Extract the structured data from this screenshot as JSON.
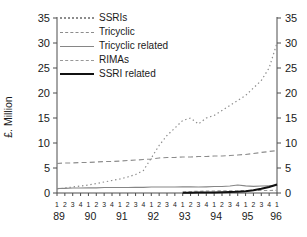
{
  "chart_data": {
    "type": "line",
    "title": "",
    "ylabel": "£. Million",
    "ylim": [
      0,
      35
    ],
    "y_ticks": [
      0,
      5,
      10,
      15,
      20,
      25,
      30,
      35
    ],
    "dual_y_axis": true,
    "grid": false,
    "legend_position": "top-left",
    "axis_color": "#4d4d4d",
    "text_color": "#1a1a1a",
    "background": "#ffffff",
    "x": [
      "89Q1",
      "89Q2",
      "89Q3",
      "89Q4",
      "90Q1",
      "90Q2",
      "90Q3",
      "90Q4",
      "91Q1",
      "91Q2",
      "91Q3",
      "91Q4",
      "92Q1",
      "92Q2",
      "92Q3",
      "92Q4",
      "93Q1",
      "93Q2",
      "93Q3",
      "93Q4",
      "94Q1",
      "94Q2",
      "94Q3",
      "94Q4",
      "95Q1",
      "95Q2",
      "95Q3",
      "95Q4",
      "96Q1"
    ],
    "quarter_labels": [
      "1",
      "2",
      "3",
      "4",
      "1",
      "2",
      "3",
      "4",
      "1",
      "2",
      "3",
      "4",
      "1",
      "2",
      "3",
      "4",
      "1",
      "2",
      "3",
      "4",
      "1",
      "2",
      "3",
      "4",
      "1",
      "2",
      "3",
      "4",
      "1"
    ],
    "year_labels": [
      "89",
      "90",
      "91",
      "92",
      "93",
      "94",
      "95",
      "96"
    ],
    "series": [
      {
        "name": "SSRIs",
        "style": "dotted",
        "color": "#8c8c8c",
        "width": 1.2,
        "values": [
          0.8,
          1.0,
          1.2,
          1.4,
          1.6,
          1.9,
          2.2,
          2.5,
          2.8,
          3.2,
          3.7,
          4.5,
          7.0,
          9.5,
          11.5,
          13.0,
          14.5,
          15.0,
          13.8,
          15.0,
          15.5,
          16.5,
          17.5,
          18.5,
          19.5,
          21.0,
          22.5,
          25.0,
          30.0
        ]
      },
      {
        "name": "Tricyclic",
        "style": "dashed",
        "color": "#8c8c8c",
        "width": 1.2,
        "values": [
          5.9,
          6.0,
          6.0,
          6.1,
          6.1,
          6.2,
          6.3,
          6.3,
          6.4,
          6.5,
          6.6,
          6.7,
          6.8,
          7.0,
          7.1,
          7.1,
          7.2,
          7.2,
          7.3,
          7.3,
          7.4,
          7.4,
          7.5,
          7.6,
          7.7,
          7.9,
          8.1,
          8.3,
          8.5
        ]
      },
      {
        "name": "Tricyclic related",
        "style": "solid",
        "color": "#868686",
        "width": 1.2,
        "values": [
          0.9,
          0.95,
          1.0,
          1.0,
          1.05,
          1.05,
          1.1,
          1.1,
          1.1,
          1.1,
          1.15,
          1.15,
          1.2,
          1.2,
          1.2,
          1.2,
          1.25,
          1.25,
          1.2,
          1.25,
          1.3,
          1.3,
          1.4,
          1.6,
          1.45,
          1.35,
          1.4,
          1.45,
          1.5
        ]
      },
      {
        "name": "RIMAs",
        "style": "dashed-short",
        "color": "#989898",
        "width": 1.1,
        "values": [
          null,
          null,
          null,
          null,
          null,
          null,
          null,
          null,
          null,
          null,
          null,
          null,
          null,
          null,
          null,
          null,
          0.2,
          0.3,
          0.35,
          0.4,
          0.4,
          0.45,
          0.45,
          0.5,
          0.5,
          0.5,
          0.5,
          0.5,
          0.55
        ]
      },
      {
        "name": "SSRI related",
        "style": "solid-thick",
        "color": "#111111",
        "width": 2.0,
        "values": [
          null,
          null,
          null,
          null,
          null,
          null,
          null,
          null,
          null,
          null,
          null,
          null,
          null,
          null,
          null,
          null,
          0.05,
          0.05,
          0.1,
          0.1,
          0.1,
          0.15,
          0.2,
          0.25,
          0.35,
          0.55,
          0.85,
          1.2,
          1.7
        ]
      }
    ]
  }
}
